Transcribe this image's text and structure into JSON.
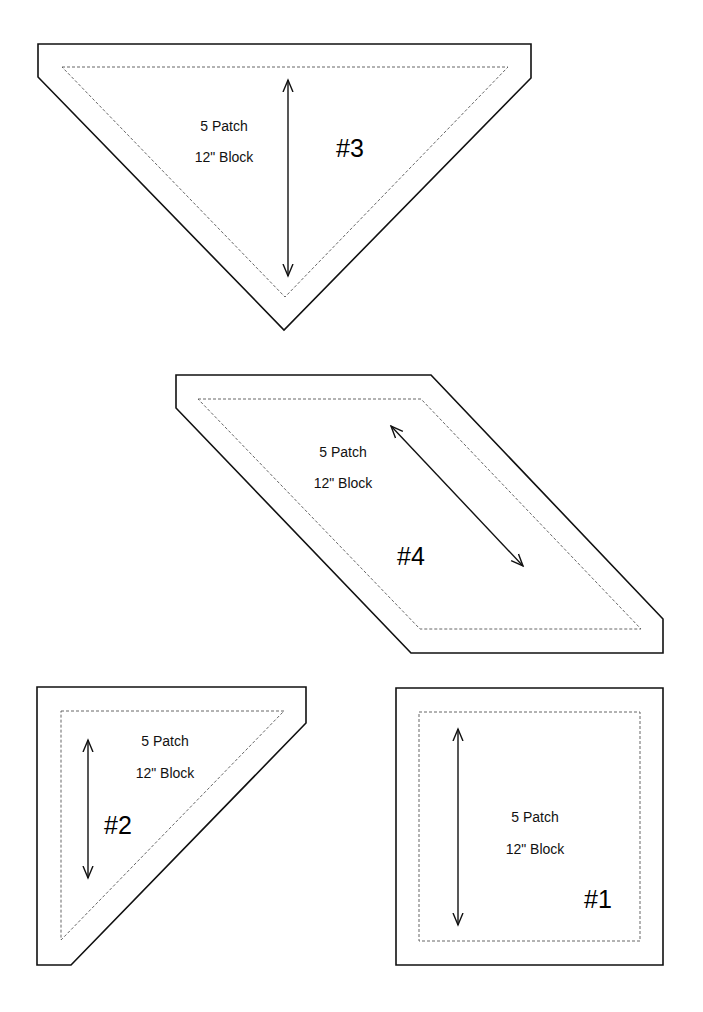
{
  "page": {
    "width": 703,
    "height": 1012,
    "background": "#ffffff"
  },
  "pieces": [
    {
      "id": "piece-3",
      "number": "#3",
      "label_line1": "5 Patch",
      "label_line2": "12\" Block",
      "shape": "triangle-down",
      "cut_line": [
        [
          38,
          44
        ],
        [
          531,
          44
        ],
        [
          531,
          78
        ],
        [
          284,
          330
        ],
        [
          38,
          77
        ]
      ],
      "sew_line": [
        [
          62,
          67
        ],
        [
          508,
          67
        ],
        [
          285,
          297
        ]
      ],
      "grain_arrow": {
        "from": [
          288,
          80
        ],
        "to": [
          288,
          276
        ]
      },
      "label1_pos": [
        224,
        131
      ],
      "label2_pos": [
        224,
        162
      ],
      "number_pos": [
        350,
        157
      ]
    },
    {
      "id": "piece-4",
      "number": "#4",
      "label_line1": "5 Patch",
      "label_line2": "12\" Block",
      "shape": "parallelogram",
      "cut_line": [
        [
          176,
          375
        ],
        [
          431,
          375
        ],
        [
          663,
          619
        ],
        [
          663,
          653
        ],
        [
          411,
          653
        ],
        [
          176,
          408
        ]
      ],
      "sew_line": [
        [
          198,
          399
        ],
        [
          421,
          399
        ],
        [
          641,
          629
        ],
        [
          420,
          629
        ]
      ],
      "grain_arrow": {
        "from": [
          391,
          426
        ],
        "to": [
          523,
          566
        ]
      },
      "label1_pos": [
        343,
        457
      ],
      "label2_pos": [
        343,
        488
      ],
      "number_pos": [
        411,
        565
      ]
    },
    {
      "id": "piece-2",
      "number": "#2",
      "label_line1": "5 Patch",
      "label_line2": "12\" Block",
      "shape": "right-triangle",
      "cut_line": [
        [
          37,
          687
        ],
        [
          306,
          687
        ],
        [
          306,
          723
        ],
        [
          71,
          965
        ],
        [
          37,
          965
        ]
      ],
      "sew_line": [
        [
          61,
          711
        ],
        [
          284,
          711
        ],
        [
          61,
          940
        ]
      ],
      "grain_arrow": {
        "from": [
          88,
          740
        ],
        "to": [
          88,
          878
        ]
      },
      "label1_pos": [
        165,
        746
      ],
      "label2_pos": [
        165,
        778
      ],
      "number_pos": [
        118,
        834
      ]
    },
    {
      "id": "piece-1",
      "number": "#1",
      "label_line1": "5 Patch",
      "label_line2": "12\" Block",
      "shape": "square",
      "cut_line": [
        [
          396,
          688
        ],
        [
          663,
          688
        ],
        [
          663,
          965
        ],
        [
          396,
          965
        ]
      ],
      "sew_line": [
        [
          419,
          712
        ],
        [
          640,
          712
        ],
        [
          640,
          941
        ],
        [
          419,
          941
        ]
      ],
      "grain_arrow": {
        "from": [
          458,
          729
        ],
        "to": [
          458,
          925
        ]
      },
      "label1_pos": [
        535,
        822
      ],
      "label2_pos": [
        535,
        854
      ],
      "number_pos": [
        598,
        908
      ]
    }
  ]
}
